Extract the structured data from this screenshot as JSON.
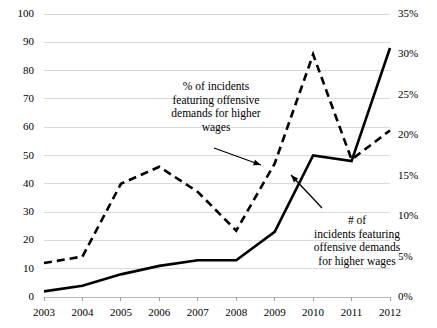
{
  "chart_data": {
    "type": "line",
    "title": "",
    "xlabel": "",
    "ylabel": "",
    "grid": true,
    "legend_position": "annotations",
    "categories": [
      "2003",
      "2004",
      "2005",
      "2006",
      "2007",
      "2008",
      "2009",
      "2010",
      "2011",
      "2012"
    ],
    "x": [
      2003,
      2004,
      2005,
      2006,
      2007,
      2008,
      2009,
      2010,
      2011,
      2012
    ],
    "axes": {
      "left": {
        "label": "",
        "ylim": [
          0,
          100
        ],
        "ticks": [
          0,
          10,
          20,
          30,
          40,
          50,
          60,
          70,
          80,
          90,
          100
        ],
        "tick_labels": [
          "0",
          "10",
          "20",
          "30",
          "40",
          "50",
          "60",
          "70",
          "80",
          "90",
          "100"
        ]
      },
      "right": {
        "label": "",
        "ylim": [
          0,
          35
        ],
        "ticks": [
          0,
          5,
          10,
          15,
          20,
          25,
          30,
          35
        ],
        "tick_labels": [
          "0%",
          "5%",
          "10%",
          "15%",
          "20%",
          "25%",
          "30%",
          "35%"
        ]
      }
    },
    "series": [
      {
        "name": "# of incidents featuring offensive demands for higher wages",
        "axis": "left",
        "style": "solid",
        "color": "#000000",
        "values": [
          2,
          4,
          8,
          11,
          13,
          13,
          23,
          50,
          48,
          88
        ]
      },
      {
        "name": "% of incidents featuring offensive demands for higher wages",
        "axis": "right",
        "style": "dashed",
        "color": "#000000",
        "values": [
          4.2,
          5.0,
          14.0,
          16.1,
          13.0,
          8.2,
          16.5,
          30.0,
          17.0,
          20.6
        ]
      }
    ],
    "annotations": [
      {
        "id": "pct",
        "text": "% of incidents\nfeaturing offensive\ndemands for higher\nwages",
        "arrow": true
      },
      {
        "id": "num",
        "text": "# of\nincidents featuring\noffensive demands\nfor higher wages",
        "arrow": true
      }
    ]
  }
}
